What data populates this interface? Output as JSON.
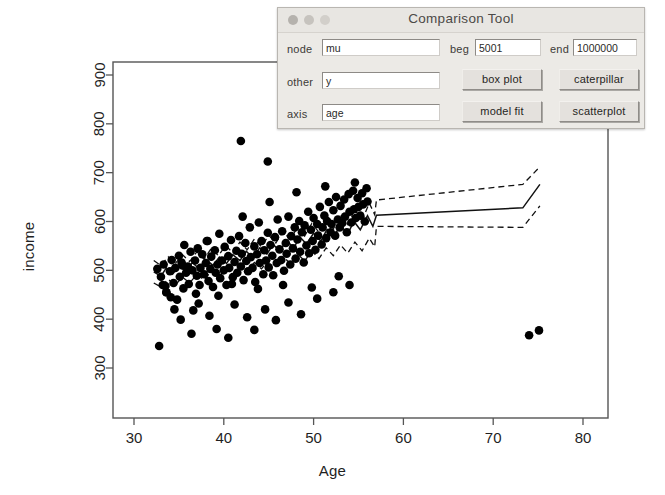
{
  "dialog": {
    "title": "Comparison Tool",
    "window_buttons": [
      "close-light",
      "minimize-light",
      "zoom-light"
    ],
    "fields": [
      {
        "name": "node",
        "label": "node",
        "value": "mu"
      },
      {
        "name": "other",
        "label": "other",
        "value": "y"
      },
      {
        "name": "axis",
        "label": "axis",
        "value": "age"
      },
      {
        "name": "beg",
        "label": "beg",
        "value": "5001"
      },
      {
        "name": "end",
        "label": "end",
        "value": "1000000"
      }
    ],
    "buttons": [
      {
        "name": "box-plot",
        "label": "box plot"
      },
      {
        "name": "caterpillar",
        "label": "caterpillar"
      },
      {
        "name": "model-fit",
        "label": "model fit"
      },
      {
        "name": "scatterplot",
        "label": "scatterplot"
      }
    ]
  },
  "chart_data": {
    "type": "scatter",
    "title": "",
    "xlabel": "Age",
    "ylabel": "income",
    "xlim": [
      30.5,
      83.0
    ],
    "ylim": [
      268,
      940
    ],
    "xticks": [
      30,
      40,
      50,
      60,
      70,
      80
    ],
    "yticks": [
      300,
      400,
      500,
      600,
      700,
      800,
      900
    ],
    "grid": false,
    "legend": null,
    "point_color": "#000000",
    "point_size": 6,
    "series": [
      {
        "name": "observations",
        "type": "scatter",
        "points": [
          [
            32.6,
            503
          ],
          [
            32.8,
            345
          ],
          [
            33.0,
            487
          ],
          [
            33.3,
            512
          ],
          [
            33.5,
            468
          ],
          [
            33.6,
            455
          ],
          [
            34.0,
            498
          ],
          [
            34.2,
            521
          ],
          [
            34.4,
            474
          ],
          [
            34.6,
            505
          ],
          [
            34.8,
            440
          ],
          [
            35.0,
            530
          ],
          [
            35.1,
            487
          ],
          [
            35.3,
            516
          ],
          [
            35.5,
            463
          ],
          [
            35.6,
            552
          ],
          [
            35.8,
            495
          ],
          [
            36.0,
            508
          ],
          [
            36.1,
            472
          ],
          [
            36.3,
            538
          ],
          [
            36.5,
            500
          ],
          [
            36.6,
            418
          ],
          [
            36.8,
            520
          ],
          [
            37.0,
            489
          ],
          [
            37.1,
            545
          ],
          [
            37.3,
            470
          ],
          [
            37.4,
            505
          ],
          [
            37.6,
            533
          ],
          [
            37.8,
            492
          ],
          [
            38.0,
            515
          ],
          [
            38.1,
            560
          ],
          [
            38.3,
            478
          ],
          [
            38.5,
            503
          ],
          [
            38.6,
            528
          ],
          [
            38.8,
            466
          ],
          [
            39.0,
            541
          ],
          [
            39.1,
            495
          ],
          [
            39.3,
            512
          ],
          [
            39.5,
            575
          ],
          [
            39.6,
            484
          ],
          [
            39.8,
            520
          ],
          [
            40.0,
            500
          ],
          [
            40.1,
            548
          ],
          [
            40.3,
            470
          ],
          [
            40.5,
            529
          ],
          [
            40.6,
            505
          ],
          [
            40.8,
            562
          ],
          [
            41.0,
            486
          ],
          [
            41.2,
            517
          ],
          [
            41.4,
            540
          ],
          [
            41.5,
            495
          ],
          [
            41.7,
            570
          ],
          [
            41.9,
            508
          ],
          [
            42.0,
            534
          ],
          [
            42.2,
            480
          ],
          [
            42.4,
            556
          ],
          [
            42.5,
            519
          ],
          [
            42.7,
            498
          ],
          [
            42.9,
            588
          ],
          [
            43.0,
            527
          ],
          [
            43.2,
            505
          ],
          [
            43.4,
            549
          ],
          [
            43.5,
            476
          ],
          [
            43.7,
            533
          ],
          [
            43.9,
            598
          ],
          [
            44.0,
            515
          ],
          [
            44.2,
            560
          ],
          [
            44.4,
            492
          ],
          [
            44.5,
            541
          ],
          [
            44.7,
            520
          ],
          [
            44.9,
            577
          ],
          [
            45.0,
            506
          ],
          [
            45.2,
            552
          ],
          [
            45.4,
            530
          ],
          [
            45.5,
            490
          ],
          [
            45.7,
            568
          ],
          [
            45.9,
            515
          ],
          [
            46.0,
            604
          ],
          [
            46.2,
            543
          ],
          [
            46.4,
            521
          ],
          [
            46.5,
            580
          ],
          [
            46.7,
            499
          ],
          [
            46.9,
            556
          ],
          [
            47.0,
            534
          ],
          [
            47.2,
            610
          ],
          [
            47.4,
            512
          ],
          [
            47.5,
            570
          ],
          [
            47.7,
            545
          ],
          [
            47.9,
            588
          ],
          [
            48.0,
            524
          ],
          [
            48.2,
            563
          ],
          [
            48.4,
            601
          ],
          [
            48.5,
            538
          ],
          [
            48.7,
            578
          ],
          [
            48.9,
            516
          ],
          [
            49.0,
            592
          ],
          [
            49.2,
            551
          ],
          [
            49.4,
            620
          ],
          [
            49.5,
            535
          ],
          [
            49.7,
            583
          ],
          [
            49.9,
            560
          ],
          [
            50.0,
            607
          ],
          [
            50.2,
            542
          ],
          [
            50.4,
            595
          ],
          [
            50.5,
            571
          ],
          [
            50.7,
            630
          ],
          [
            50.9,
            553
          ],
          [
            51.0,
            588
          ],
          [
            51.2,
            612
          ],
          [
            51.4,
            566
          ],
          [
            51.5,
            601
          ],
          [
            51.7,
            640
          ],
          [
            51.9,
            578
          ],
          [
            52.0,
            595
          ],
          [
            52.2,
            623
          ],
          [
            52.4,
            571
          ],
          [
            52.5,
            650
          ],
          [
            52.7,
            604
          ],
          [
            52.9,
            588
          ],
          [
            53.0,
            632
          ],
          [
            53.2,
            597
          ],
          [
            53.4,
            645
          ],
          [
            53.5,
            610
          ],
          [
            53.7,
            578
          ],
          [
            53.9,
            656
          ],
          [
            54.0,
            620
          ],
          [
            54.2,
            598
          ],
          [
            54.4,
            663
          ],
          [
            54.5,
            625
          ],
          [
            54.7,
            607
          ],
          [
            54.9,
            648
          ],
          [
            55.0,
            630
          ],
          [
            55.2,
            612
          ],
          [
            55.4,
            658
          ],
          [
            55.5,
            635
          ],
          [
            55.7,
            600
          ],
          [
            55.9,
            668
          ],
          [
            56.0,
            641
          ],
          [
            33.6,
            455
          ],
          [
            34.5,
            420
          ],
          [
            35.2,
            399
          ],
          [
            36.4,
            370
          ],
          [
            37.2,
            432
          ],
          [
            38.4,
            407
          ],
          [
            39.2,
            380
          ],
          [
            40.5,
            362
          ],
          [
            41.2,
            430
          ],
          [
            42.6,
            404
          ],
          [
            43.4,
            378
          ],
          [
            44.6,
            420
          ],
          [
            45.8,
            398
          ],
          [
            47.2,
            434
          ],
          [
            48.6,
            410
          ],
          [
            50.4,
            442
          ],
          [
            52.2,
            455
          ],
          [
            54.0,
            470
          ],
          [
            33.2,
            470
          ],
          [
            34.1,
            445
          ],
          [
            35.4,
            510
          ],
          [
            36.9,
            452
          ],
          [
            38.2,
            560
          ],
          [
            39.4,
            448
          ],
          [
            40.9,
            472
          ],
          [
            42.1,
            610
          ],
          [
            43.8,
            462
          ],
          [
            45.1,
            640
          ],
          [
            46.6,
            470
          ],
          [
            48.1,
            660
          ],
          [
            49.8,
            465
          ],
          [
            51.3,
            672
          ],
          [
            52.8,
            488
          ],
          [
            54.6,
            680
          ],
          [
            44.9,
            723
          ],
          [
            41.9,
            765
          ],
          [
            74.0,
            367
          ],
          [
            75.1,
            377
          ]
        ]
      },
      {
        "name": "fit-median",
        "type": "line",
        "style": "solid",
        "points": [
          [
            32.2,
            497
          ],
          [
            33.0,
            488
          ],
          [
            33.6,
            505
          ],
          [
            34.3,
            492
          ],
          [
            35.0,
            508
          ],
          [
            35.8,
            498
          ],
          [
            36.5,
            516
          ],
          [
            37.2,
            504
          ],
          [
            38.0,
            522
          ],
          [
            38.8,
            510
          ],
          [
            39.5,
            527
          ],
          [
            40.3,
            514
          ],
          [
            41.0,
            532
          ],
          [
            41.8,
            520
          ],
          [
            42.5,
            539
          ],
          [
            43.2,
            526
          ],
          [
            44.0,
            546
          ],
          [
            44.8,
            533
          ],
          [
            45.5,
            553
          ],
          [
            46.2,
            540
          ],
          [
            47.0,
            560
          ],
          [
            47.8,
            547
          ],
          [
            48.5,
            568
          ],
          [
            49.2,
            554
          ],
          [
            50.0,
            576
          ],
          [
            50.8,
            560
          ],
          [
            51.5,
            584
          ],
          [
            52.2,
            568
          ],
          [
            53.0,
            592
          ],
          [
            53.8,
            575
          ],
          [
            54.5,
            600
          ],
          [
            55.2,
            583
          ],
          [
            56.0,
            612
          ],
          [
            56.6,
            590
          ],
          [
            57.0,
            613
          ],
          [
            73.3,
            628
          ],
          [
            75.2,
            676
          ]
        ]
      },
      {
        "name": "fit-upper",
        "type": "line",
        "style": "dashed",
        "points": [
          [
            32.2,
            520
          ],
          [
            33.0,
            510
          ],
          [
            33.8,
            528
          ],
          [
            34.6,
            514
          ],
          [
            35.4,
            532
          ],
          [
            36.2,
            518
          ],
          [
            37.0,
            538
          ],
          [
            37.8,
            523
          ],
          [
            38.6,
            545
          ],
          [
            39.4,
            530
          ],
          [
            40.2,
            551
          ],
          [
            41.0,
            536
          ],
          [
            41.8,
            558
          ],
          [
            42.6,
            542
          ],
          [
            43.4,
            564
          ],
          [
            44.2,
            548
          ],
          [
            45.0,
            572
          ],
          [
            45.8,
            556
          ],
          [
            46.6,
            580
          ],
          [
            47.4,
            563
          ],
          [
            48.2,
            588
          ],
          [
            49.0,
            570
          ],
          [
            49.8,
            596
          ],
          [
            50.6,
            578
          ],
          [
            51.4,
            604
          ],
          [
            52.2,
            585
          ],
          [
            53.0,
            614
          ],
          [
            53.8,
            594
          ],
          [
            54.6,
            624
          ],
          [
            55.4,
            602
          ],
          [
            56.2,
            638
          ],
          [
            56.8,
            614
          ],
          [
            57.0,
            644
          ],
          [
            73.3,
            676
          ],
          [
            75.2,
            712
          ]
        ]
      },
      {
        "name": "fit-lower",
        "type": "line",
        "style": "dashed",
        "points": [
          [
            32.2,
            474
          ],
          [
            33.0,
            466
          ],
          [
            33.8,
            482
          ],
          [
            34.6,
            470
          ],
          [
            35.4,
            486
          ],
          [
            36.2,
            474
          ],
          [
            37.0,
            492
          ],
          [
            37.8,
            480
          ],
          [
            38.6,
            498
          ],
          [
            39.4,
            486
          ],
          [
            40.2,
            504
          ],
          [
            41.0,
            492
          ],
          [
            41.8,
            510
          ],
          [
            42.6,
            497
          ],
          [
            43.4,
            516
          ],
          [
            44.2,
            503
          ],
          [
            45.0,
            522
          ],
          [
            45.8,
            508
          ],
          [
            46.6,
            528
          ],
          [
            47.4,
            514
          ],
          [
            48.2,
            534
          ],
          [
            49.0,
            519
          ],
          [
            49.8,
            540
          ],
          [
            50.6,
            524
          ],
          [
            51.4,
            546
          ],
          [
            52.2,
            530
          ],
          [
            53.0,
            552
          ],
          [
            53.8,
            535
          ],
          [
            54.6,
            558
          ],
          [
            55.4,
            540
          ],
          [
            56.2,
            566
          ],
          [
            56.8,
            548
          ],
          [
            57.0,
            590
          ],
          [
            73.3,
            588
          ],
          [
            75.2,
            632
          ]
        ]
      }
    ]
  }
}
